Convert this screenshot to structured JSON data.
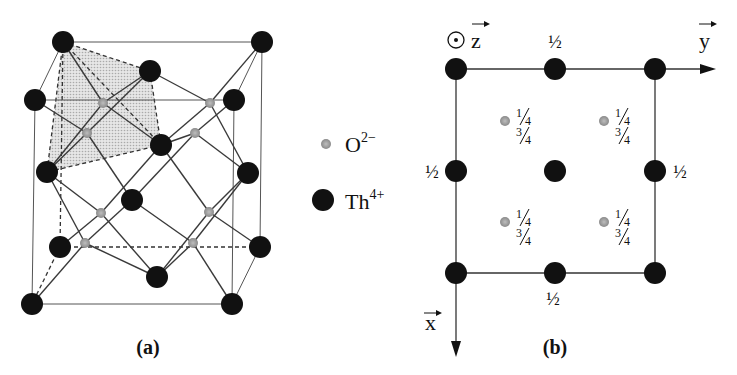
{
  "figure": {
    "panel_a": {
      "caption": "(a)",
      "description": "Fluorite (ThO2) unit cell, perspective view",
      "th_atoms": [
        [
          63,
          42
        ],
        [
          262,
          42
        ],
        [
          35,
          100
        ],
        [
          234,
          100
        ],
        [
          150,
          71
        ],
        [
          161,
          145
        ],
        [
          47,
          172
        ],
        [
          248,
          173
        ],
        [
          132,
          200
        ],
        [
          60,
          247
        ],
        [
          260,
          247
        ],
        [
          32,
          304
        ],
        [
          232,
          304
        ],
        [
          157,
          277
        ]
      ],
      "o_atoms": [
        [
          103,
          103
        ],
        [
          210,
          103
        ],
        [
          87,
          133
        ],
        [
          195,
          133
        ],
        [
          101,
          213
        ],
        [
          209,
          212
        ],
        [
          85,
          243
        ],
        [
          193,
          243
        ]
      ]
    },
    "legend": {
      "items": [
        {
          "symbol": "small-gray-dot",
          "label": "O",
          "charge": "2−"
        },
        {
          "symbol": "large-black-dot",
          "label": "Th",
          "charge": "4+"
        }
      ]
    },
    "panel_b": {
      "caption": "(b)",
      "description": "Projection onto xy plane",
      "axis_z": "z",
      "axis_y": "y",
      "axis_x": "x",
      "half": "½",
      "quarter_num": "1",
      "quarter_den": "4",
      "three_quarter_num": "3",
      "three_quarter_den": "4",
      "th_atoms": [
        [
          456,
          69
        ],
        [
          555,
          69
        ],
        [
          655,
          69
        ],
        [
          456,
          171
        ],
        [
          555,
          171
        ],
        [
          655,
          171
        ],
        [
          456,
          273
        ],
        [
          555,
          273
        ],
        [
          655,
          273
        ]
      ],
      "o_atoms": [
        [
          505,
          121
        ],
        [
          604,
          121
        ],
        [
          505,
          222
        ],
        [
          604,
          222
        ]
      ]
    }
  },
  "colors": {
    "th": "#111111",
    "o": "#9a9a9a",
    "shade": "#d8d8d8",
    "line": "#444444"
  }
}
